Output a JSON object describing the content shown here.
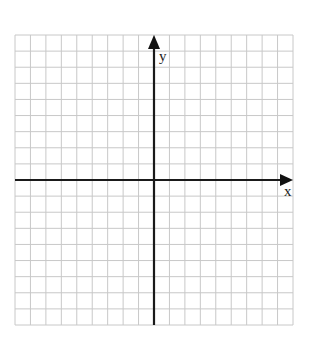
{
  "diagram": {
    "type": "coordinate-plane",
    "grid": {
      "columns": 18,
      "rows": 18,
      "left": 15,
      "top": 35,
      "right": 293,
      "bottom": 325,
      "line_color": "#c8c8c8",
      "axis_color": "#1a1a1a"
    },
    "axes": {
      "x_label": "x",
      "y_label": "y",
      "origin_column": 9,
      "origin_row": 9
    }
  }
}
